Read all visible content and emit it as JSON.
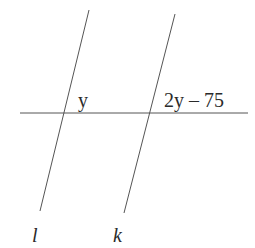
{
  "diagram": {
    "type": "parallel-lines-transversal",
    "line_color": "#555555",
    "text_color": "#2a2a2a",
    "lines": [
      {
        "name": "l",
        "x1": 89,
        "y1": 10,
        "x2": 40,
        "y2": 211
      },
      {
        "name": "k",
        "x1": 175,
        "y1": 14,
        "x2": 124,
        "y2": 213
      },
      {
        "name": "transversal",
        "x1": 20,
        "y1": 113,
        "x2": 248,
        "y2": 113
      }
    ],
    "angle_labels": {
      "left": "y",
      "right": "2y – 75"
    },
    "line_labels": {
      "l": "l",
      "k": "k"
    }
  }
}
